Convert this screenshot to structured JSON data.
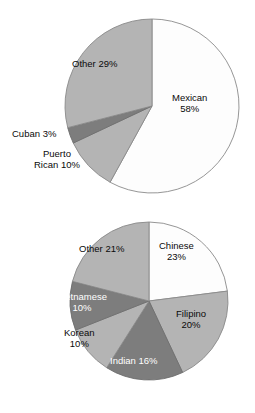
{
  "page": {
    "background_color": "#ffffff",
    "text_color": "#000000",
    "on_dark_text_color": "#ffffff"
  },
  "charts": [
    {
      "id": "hispanic-origin-pie",
      "name": "hispanic-origin-pie-chart",
      "geometry": {
        "cx": 152,
        "cy": 106,
        "r": 87,
        "start_angle_deg": 0
      },
      "slices": [
        {
          "key": "mexican",
          "label": "Mexican",
          "percent_text": "58%",
          "value": 58,
          "color": "#fdfdfd",
          "stroke": "#8a8a8a",
          "text_on_dark": false,
          "label_lines": [
            "Mexican",
            "58%"
          ],
          "label_left": 172,
          "label_top": 92
        },
        {
          "key": "puerto-rican",
          "label": "Puerto Rican",
          "percent_text": "10%",
          "value": 10,
          "color": "#b4b4b4",
          "stroke": "#8a8a8a",
          "text_on_dark": false,
          "label_lines": [
            "Puerto",
            "Rican 10%"
          ],
          "label_left": 34,
          "label_top": 148
        },
        {
          "key": "cuban",
          "label": "Cuban",
          "percent_text": "3%",
          "value": 3,
          "color": "#7d7d7d",
          "stroke": "#6e6e6e",
          "text_on_dark": false,
          "label_lines": [
            "Cuban 3%"
          ],
          "label_left": 12,
          "label_top": 128
        },
        {
          "key": "other",
          "label": "Other",
          "percent_text": "29%",
          "value": 29,
          "color": "#b4b4b4",
          "stroke": "#8a8a8a",
          "text_on_dark": false,
          "label_lines": [
            "Other 29%"
          ],
          "label_left": 72,
          "label_top": 58
        }
      ]
    },
    {
      "id": "asian-origin-pie",
      "name": "asian-origin-pie-chart",
      "geometry": {
        "cx": 149,
        "cy": 301,
        "r": 79,
        "start_angle_deg": 0
      },
      "slices": [
        {
          "key": "chinese",
          "label": "Chinese",
          "percent_text": "23%",
          "value": 23,
          "color": "#fdfdfd",
          "stroke": "#8a8a8a",
          "text_on_dark": false,
          "label_lines": [
            "Chinese",
            "23%"
          ],
          "label_left": 159,
          "label_top": 240
        },
        {
          "key": "filipino",
          "label": "Filipino",
          "percent_text": "20%",
          "value": 20,
          "color": "#b4b4b4",
          "stroke": "#8a8a8a",
          "text_on_dark": false,
          "label_lines": [
            "Filipino",
            "20%"
          ],
          "label_left": 176,
          "label_top": 308
        },
        {
          "key": "indian",
          "label": "Indian",
          "percent_text": "16%",
          "value": 16,
          "color": "#7d7d7d",
          "stroke": "#6e6e6e",
          "text_on_dark": true,
          "label_lines": [
            "Indian 16%"
          ],
          "label_left": 110,
          "label_top": 355
        },
        {
          "key": "korean",
          "label": "Korean",
          "percent_text": "10%",
          "value": 10,
          "color": "#b4b4b4",
          "stroke": "#8a8a8a",
          "text_on_dark": false,
          "label_lines": [
            "Korean",
            "10%"
          ],
          "label_left": 64,
          "label_top": 327
        },
        {
          "key": "vietnamese",
          "label": "Vietnamese",
          "percent_text": "10%",
          "value": 10,
          "color": "#7d7d7d",
          "stroke": "#6e6e6e",
          "text_on_dark": true,
          "label_lines": [
            "Vietnamese",
            "10%"
          ],
          "label_left": 57,
          "label_top": 291
        },
        {
          "key": "other",
          "label": "Other",
          "percent_text": "21%",
          "value": 21,
          "color": "#b4b4b4",
          "stroke": "#8a8a8a",
          "text_on_dark": false,
          "label_lines": [
            "Other 21%"
          ],
          "label_left": 79,
          "label_top": 243
        }
      ]
    }
  ],
  "chart_data": [
    {
      "type": "pie",
      "title": "",
      "id": "hispanic-origin-pie",
      "categories": [
        "Mexican",
        "Puerto Rican",
        "Cuban",
        "Other"
      ],
      "values": [
        58,
        10,
        3,
        29
      ],
      "value_unit": "percent",
      "labels": [
        "Mexican 58%",
        "Puerto Rican 10%",
        "Cuban 3%",
        "Other 29%"
      ],
      "colors": [
        "#fdfdfd",
        "#b4b4b4",
        "#7d7d7d",
        "#b4b4b4"
      ],
      "legend": "none",
      "label_position": "inside-and-outside",
      "start_angle_deg": 0,
      "direction": "clockwise",
      "total": 100
    },
    {
      "type": "pie",
      "title": "",
      "id": "asian-origin-pie",
      "categories": [
        "Chinese",
        "Filipino",
        "Indian",
        "Korean",
        "Vietnamese",
        "Other"
      ],
      "values": [
        23,
        20,
        16,
        10,
        10,
        21
      ],
      "value_unit": "percent",
      "labels": [
        "Chinese 23%",
        "Filipino 20%",
        "Indian 16%",
        "Korean 10%",
        "Vietnamese 10%",
        "Other 21%"
      ],
      "colors": [
        "#fdfdfd",
        "#b4b4b4",
        "#7d7d7d",
        "#b4b4b4",
        "#7d7d7d",
        "#b4b4b4"
      ],
      "legend": "none",
      "label_position": "inside",
      "start_angle_deg": 0,
      "direction": "clockwise",
      "total": 100
    }
  ]
}
